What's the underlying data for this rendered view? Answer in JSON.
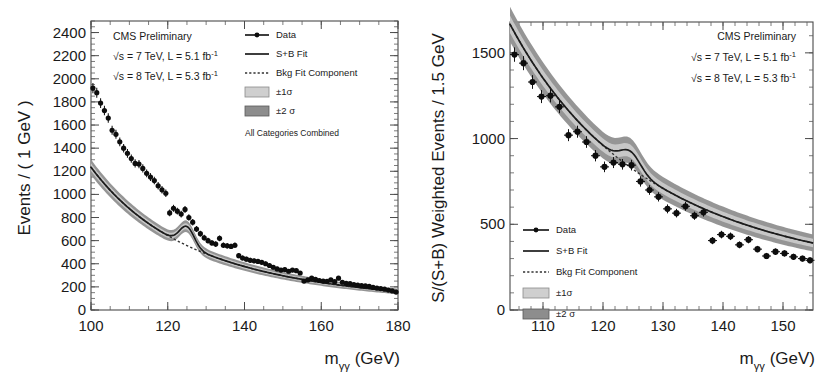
{
  "figure": {
    "background": "#ffffff",
    "marker_color": "#0d0d0d",
    "fit_color": "#1c1c1c",
    "band1_color": "#c9c9c9",
    "band2_color": "#8f8f8f"
  },
  "panels": [
    {
      "id": "left",
      "header": {
        "line1": "CMS Preliminary",
        "line2": "√s = 7 TeV, L = 5.1 fb",
        "line2_sup": "-1",
        "line3": "√s = 8 TeV, L = 5.3 fb",
        "line3_sup": "-1"
      },
      "note": "All Categories Combined",
      "legend": [
        {
          "label": "Data",
          "kind": "marker-line"
        },
        {
          "label": "S+B Fit",
          "kind": "solid-line"
        },
        {
          "label": "Bkg Fit Component",
          "kind": "dashed-line"
        },
        {
          "label": "±1σ",
          "kind": "swatch-light"
        },
        {
          "label": "±2 σ",
          "kind": "swatch-dark"
        }
      ],
      "chart_data": {
        "type": "scatter",
        "title": "CMS Preliminary",
        "xlabel": "m_γγ (GeV)",
        "ylabel": "Events / ( 1 GeV )",
        "xlim": [
          100,
          180
        ],
        "ylim": [
          0,
          2500
        ],
        "xticks": [
          100,
          120,
          140,
          160,
          180
        ],
        "xticklabels": [
          "100",
          "120",
          "140",
          "160",
          "180"
        ],
        "yticks": [
          0,
          200,
          400,
          600,
          800,
          1000,
          1200,
          1400,
          1600,
          1800,
          2000,
          2200,
          2400
        ],
        "yticklabels": [
          "0",
          "200",
          "400",
          "600",
          "800",
          "1000",
          "1200",
          "1400",
          "1600",
          "1800",
          "2000",
          "2200",
          "2400"
        ],
        "x_minor_step": 5,
        "y_minor_step": 50,
        "grid": false,
        "legend_position": "top-right",
        "bin_width": 1,
        "series": [
          {
            "name": "Data",
            "kind": "points_with_errors",
            "x": [
              100.5,
              101.5,
              102.5,
              103.5,
              104.5,
              105.5,
              106.5,
              107.5,
              108.5,
              109.5,
              110.5,
              111.5,
              112.5,
              113.5,
              114.5,
              115.5,
              116.5,
              117.5,
              118.5,
              119.5,
              120.5,
              121.5,
              122.5,
              123.5,
              124.5,
              125.5,
              126.5,
              127.5,
              128.5,
              129.5,
              130.5,
              131.5,
              132.5,
              133.5,
              134.5,
              135.5,
              136.5,
              137.5,
              138.5,
              139.5,
              140.5,
              141.5,
              142.5,
              143.5,
              144.5,
              145.5,
              146.5,
              147.5,
              148.5,
              149.5,
              150.5,
              151.5,
              152.5,
              153.5,
              154.5,
              155.5,
              156.5,
              157.5,
              158.5,
              159.5,
              160.5,
              161.5,
              162.5,
              163.5,
              164.5,
              165.5,
              166.5,
              167.5,
              168.5,
              169.5,
              170.5,
              171.5,
              172.5,
              173.5,
              174.5,
              175.5,
              176.5,
              177.5,
              178.5,
              179.5
            ],
            "y": [
              1920,
              1880,
              1790,
              1725,
              1660,
              1555,
              1520,
              1455,
              1400,
              1355,
              1310,
              1268,
              1262,
              1225,
              1182,
              1150,
              1120,
              1075,
              1040,
              1010,
              840,
              880,
              855,
              830,
              870,
              800,
              760,
              700,
              660,
              625,
              600,
              580,
              570,
              620,
              560,
              555,
              550,
              560,
              470,
              450,
              440,
              430,
              425,
              420,
              412,
              400,
              385,
              370,
              355,
              345,
              350,
              335,
              345,
              340,
              320,
              250,
              260,
              275,
              265,
              255,
              250,
              248,
              260,
              245,
              275,
              240,
              230,
              228,
              220,
              215,
              210,
              208,
              205,
              195,
              190,
              185,
              180,
              172,
              165,
              155
            ],
            "yerr": [
              44,
              43,
              42,
              41,
              41,
              39,
              39,
              38,
              37,
              37,
              36,
              36,
              36,
              35,
              34,
              34,
              33,
              33,
              32,
              32,
              29,
              30,
              29,
              29,
              30,
              28,
              28,
              26,
              26,
              25,
              24,
              24,
              24,
              25,
              24,
              24,
              23,
              24,
              22,
              21,
              21,
              21,
              21,
              20,
              20,
              20,
              20,
              19,
              19,
              19,
              19,
              18,
              19,
              18,
              18,
              16,
              16,
              17,
              16,
              16,
              16,
              16,
              16,
              16,
              17,
              15,
              15,
              15,
              15,
              15,
              14,
              14,
              14,
              14,
              14,
              14,
              13,
              13,
              13,
              12
            ]
          },
          {
            "name": "S+B Fit",
            "kind": "curve",
            "description": "smooth falling background plus small Higgs signal peak near 125 GeV"
          },
          {
            "name": "Bkg Fit Component",
            "kind": "dashed_curve",
            "description": "smooth falling background only"
          }
        ]
      }
    },
    {
      "id": "right",
      "header": {
        "line1": "CMS Preliminary",
        "line2": "√s = 7 TeV, L = 5.1 fb",
        "line2_sup": "-1",
        "line3": "√s = 8 TeV, L = 5.3 fb",
        "line3_sup": "-1"
      },
      "note": "",
      "legend": [
        {
          "label": "Data",
          "kind": "marker-line"
        },
        {
          "label": "S+B Fit",
          "kind": "solid-line"
        },
        {
          "label": "Bkg Fit Component",
          "kind": "dashed-line"
        },
        {
          "label": "±1σ",
          "kind": "swatch-light"
        },
        {
          "label": "±2 σ",
          "kind": "swatch-dark"
        }
      ],
      "chart_data": {
        "type": "scatter",
        "title": "CMS Preliminary",
        "xlabel": "m_γγ (GeV)",
        "ylabel": "S/(S+B) Weighted Events / 1.5 GeV",
        "xlim": [
          104.5,
          155
        ],
        "ylim": [
          0,
          1680
        ],
        "xticks": [
          110,
          120,
          130,
          140,
          150
        ],
        "xticklabels": [
          "110",
          "120",
          "130",
          "140",
          "150"
        ],
        "yticks": [
          0,
          500,
          1000,
          1500
        ],
        "yticklabels": [
          "0",
          "500",
          "1000",
          "1500"
        ],
        "x_minor_step": 2,
        "y_minor_step": 100,
        "grid": false,
        "legend_position": "lower-left",
        "bin_width": 1.5,
        "series": [
          {
            "name": "Data",
            "kind": "points_with_errors",
            "x": [
              105.25,
              106.75,
              108.25,
              109.75,
              111.25,
              112.75,
              114.25,
              115.75,
              117.25,
              118.75,
              120.25,
              121.75,
              123.25,
              124.75,
              126.25,
              127.75,
              129.25,
              130.75,
              132.25,
              133.75,
              135.25,
              136.75,
              138.25,
              139.75,
              141.25,
              142.75,
              144.25,
              145.75,
              147.25,
              148.75,
              150.25,
              151.75,
              153.25,
              154.5
            ],
            "y": [
              1490,
              1440,
              1330,
              1245,
              1250,
              1185,
              1020,
              1040,
              980,
              900,
              835,
              860,
              850,
              845,
              750,
              700,
              660,
              590,
              565,
              605,
              550,
              570,
              405,
              440,
              430,
              380,
              410,
              355,
              315,
              340,
              330,
              310,
              300,
              290
            ],
            "yerr": [
              42,
              41,
              40,
              38,
              39,
              37,
              35,
              35,
              34,
              33,
              31,
              32,
              31,
              31,
              30,
              28,
              27,
              26,
              25,
              26,
              24,
              25,
              21,
              22,
              22,
              20,
              21,
              19,
              18,
              19,
              18,
              18,
              17,
              17
            ],
            "xerr": [
              0.75,
              0.75,
              0.75,
              0.75,
              0.75,
              0.75,
              0.75,
              0.75,
              0.75,
              0.75,
              0.75,
              0.75,
              0.75,
              0.75,
              0.75,
              0.75,
              0.75,
              0.75,
              0.75,
              0.75,
              0.75,
              0.75,
              0.75,
              0.75,
              0.75,
              0.75,
              0.75,
              0.75,
              0.75,
              0.75,
              0.75,
              0.75,
              0.75,
              0.75
            ]
          },
          {
            "name": "S+B Fit",
            "kind": "curve",
            "description": "falling background plus clear Higgs signal bump peaking near 125 GeV"
          },
          {
            "name": "Bkg Fit Component",
            "kind": "dashed_curve",
            "description": "smooth falling background only"
          }
        ]
      }
    }
  ]
}
